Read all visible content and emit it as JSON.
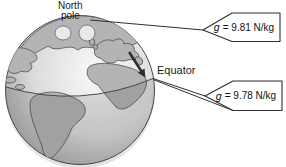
{
  "labels": {
    "north_line1": "North",
    "north_line2": "pole",
    "equator": "Equator"
  },
  "callouts": {
    "pole": {
      "symbol": "g",
      "text": "= 9.81 N/kg"
    },
    "equator": {
      "symbol": "g",
      "text": "= 9.78 N/kg"
    }
  },
  "colors": {
    "background": "#ffffff",
    "ink": "#2f2f2f",
    "land_fill": "#b4b4b4",
    "land_outline": "#4f4f4f",
    "ocean_light": "#fafafa",
    "ocean_mid": "#dcdcdc",
    "ocean_rim": "#9b9b9b",
    "inlet_fill": "#e9e9e9",
    "arrow_fill": "#2e2e2e",
    "callout_fill": "#ffffff"
  }
}
